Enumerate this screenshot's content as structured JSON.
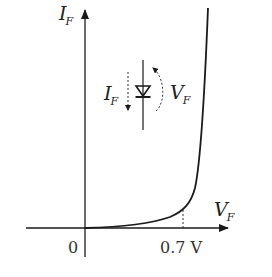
{
  "diagram": {
    "y_axis": {
      "symbol": "I",
      "subscript": "F"
    },
    "x_axis": {
      "symbol": "V",
      "subscript": "F"
    },
    "origin_label": "0",
    "knee_label": "0.7 V",
    "diode_symbol": {
      "current_label": {
        "symbol": "I",
        "subscript": "F"
      },
      "voltage_label": {
        "symbol": "V",
        "subscript": "F"
      }
    },
    "colors": {
      "line": "#1a1a1a",
      "text": "#222222",
      "background": "#ffffff"
    }
  }
}
